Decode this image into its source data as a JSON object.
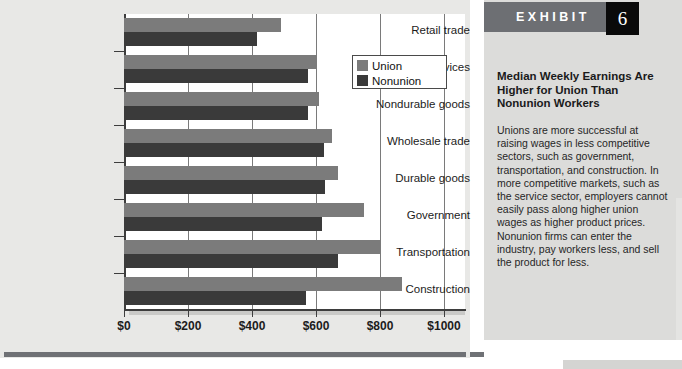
{
  "exhibit": {
    "header_label": "EXHIBIT",
    "number": "6",
    "title": "Median Weekly Earnings Are Higher for Union Than Nonunion Workers",
    "body": "Unions are more successful at raising wages in less competitive sectors, such as government, transportation, and construction. In more competitive markets, such as the service sector, employers cannot easily pass along higher union wages as higher product prices. Nonunion firms can enter the industry, pay workers less, and sell the product for less.",
    "colors": {
      "header_band": "#6d6f73",
      "number_box": "#0a0a0a",
      "panel_bg": "#dcdcda"
    }
  },
  "chart_data": {
    "type": "bar",
    "orientation": "horizontal",
    "title": "",
    "xlabel": "",
    "ylabel": "",
    "xlim": [
      0,
      1000
    ],
    "xticks": [
      0,
      200,
      400,
      600,
      800,
      1000
    ],
    "xtick_labels": [
      "$0",
      "$200",
      "$400",
      "$600",
      "$800",
      "$1000"
    ],
    "grid": "vertical",
    "legend_position": "upper right",
    "categories": [
      "Retail trade",
      "Services",
      "Nondurable goods",
      "Wholesale trade",
      "Durable goods",
      "Government",
      "Transportation",
      "Construction"
    ],
    "series": [
      {
        "name": "Union",
        "color": "#7b7b7b",
        "values": [
          490,
          600,
          610,
          650,
          670,
          750,
          800,
          870
        ]
      },
      {
        "name": "Nonunion",
        "color": "#3a3a3a",
        "values": [
          415,
          575,
          575,
          625,
          627,
          620,
          670,
          570
        ]
      }
    ]
  }
}
